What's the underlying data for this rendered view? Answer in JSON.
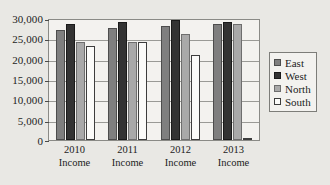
{
  "chart_data": {
    "type": "bar",
    "title": "",
    "xlabel": "",
    "ylabel": "",
    "ylim": [
      0,
      30000
    ],
    "ytick_step": 5000,
    "grid": true,
    "legend_position": "right",
    "categories": [
      "2010 Income",
      "2011 Income",
      "2012 Income",
      "2013 Income"
    ],
    "category_lines": [
      {
        "line1": "2010",
        "line2": "Income"
      },
      {
        "line1": "2011",
        "line2": "Income"
      },
      {
        "line1": "2012",
        "line2": "Income"
      },
      {
        "line1": "2013",
        "line2": "Income"
      }
    ],
    "ytick_labels": [
      "30,000",
      "25,000",
      "20,000",
      "15,000",
      "10,000",
      "5,000",
      "0"
    ],
    "ytick_values": [
      30000,
      25000,
      20000,
      15000,
      10000,
      5000,
      0
    ],
    "series": [
      {
        "name": "East",
        "color": "#7f7f7f",
        "values": [
          27000,
          27500,
          28000,
          28500
        ]
      },
      {
        "name": "West",
        "color": "#333333",
        "values": [
          28500,
          29000,
          29500,
          29000
        ]
      },
      {
        "name": "North",
        "color": "#a9a9a9",
        "values": [
          24000,
          24000,
          26000,
          28500
        ]
      },
      {
        "name": "South",
        "color": "#fbfbf9",
        "values": [
          23000,
          24000,
          21000,
          500
        ]
      }
    ],
    "legend": [
      {
        "label": "East",
        "color": "#7f7f7f"
      },
      {
        "label": "West",
        "color": "#333333"
      },
      {
        "label": "North",
        "color": "#a9a9a9"
      },
      {
        "label": "South",
        "color": "#fbfbf9"
      }
    ]
  }
}
